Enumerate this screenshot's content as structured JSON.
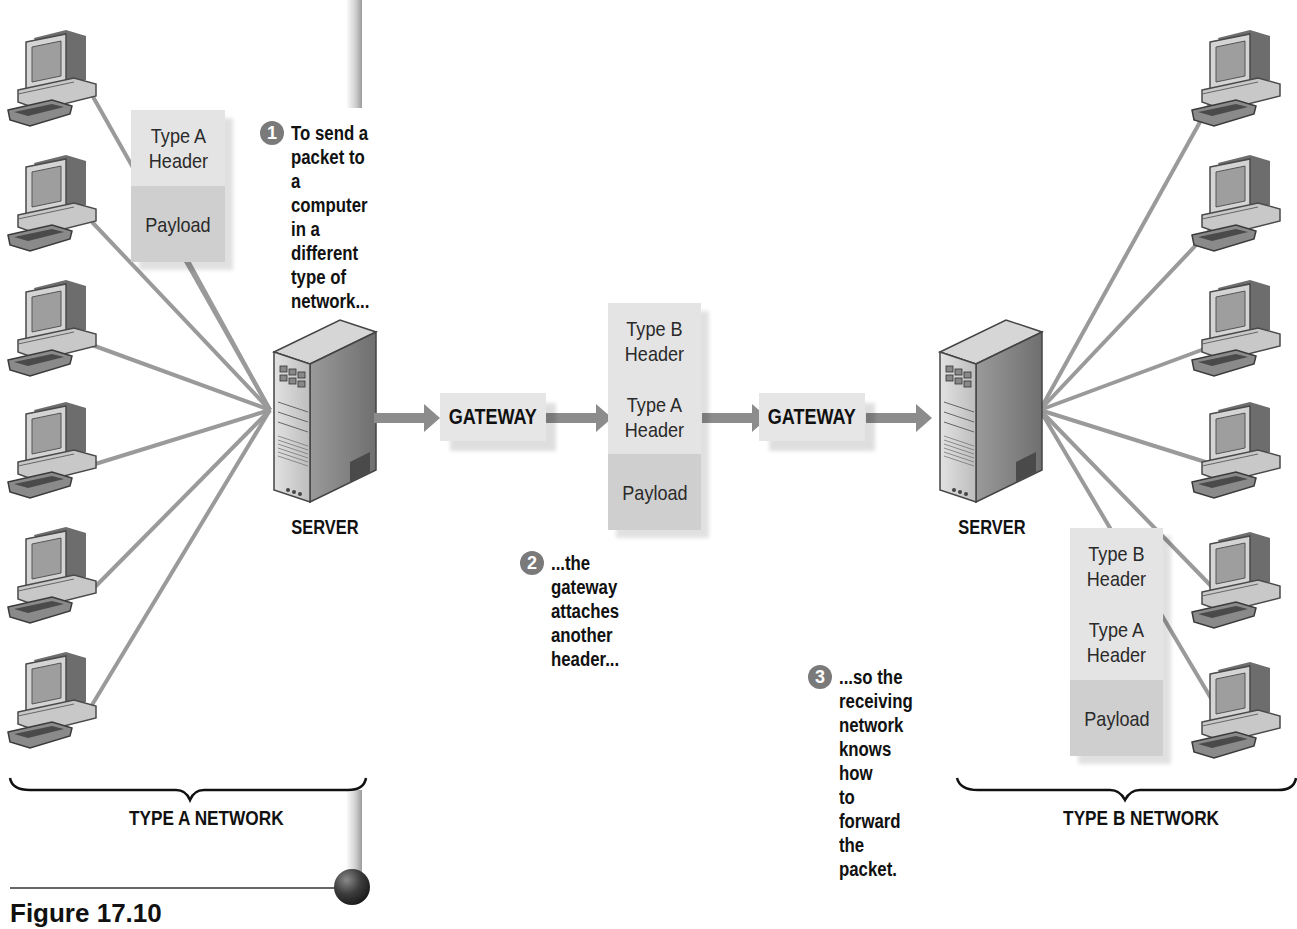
{
  "figure": {
    "caption": "Figure 17.10"
  },
  "networks": {
    "left": {
      "label": "TYPE A NETWORK",
      "server_label": "SERVER",
      "computer_count": 6
    },
    "right": {
      "label": "TYPE B NETWORK",
      "server_label": "SERVER",
      "computer_count": 6
    }
  },
  "gateways": [
    {
      "label": "GATEWAY"
    },
    {
      "label": "GATEWAY"
    }
  ],
  "packets": {
    "original": {
      "segments": [
        {
          "type": "header",
          "label": "Type A\nHeader"
        },
        {
          "type": "payload",
          "label": "Payload"
        }
      ]
    },
    "encapsulated": {
      "segments": [
        {
          "type": "header",
          "label": "Type B\nHeader"
        },
        {
          "type": "header",
          "label": "Type A\nHeader"
        },
        {
          "type": "payload",
          "label": "Payload"
        }
      ]
    },
    "received": {
      "segments": [
        {
          "type": "header",
          "label": "Type B\nHeader"
        },
        {
          "type": "header",
          "label": "Type A\nHeader"
        },
        {
          "type": "payload",
          "label": "Payload"
        }
      ]
    }
  },
  "steps": [
    {
      "number": "1",
      "text": "To send a packet to a computer\nin a different type of network..."
    },
    {
      "number": "2",
      "text": "...the gateway attaches\nanother header..."
    },
    {
      "number": "3",
      "text": "...so the receiving\nnetwork knows how\nto forward the packet."
    }
  ],
  "colors": {
    "link": "#9a9a9a",
    "arrow": "#8c8c8c",
    "header_fill": "#e4e4e4",
    "payload_fill": "#cfcfcf",
    "step_badge": "#7a7a7a"
  }
}
